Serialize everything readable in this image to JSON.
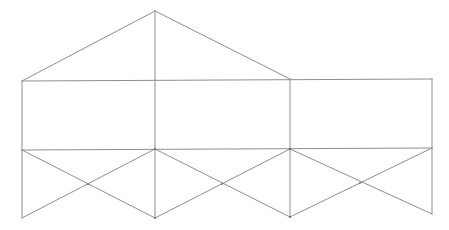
{
  "figure": {
    "title": "Line wireframe drawing of a gabled building net",
    "type": "line-drawing",
    "canvas": {
      "width": 449,
      "height": 230,
      "background": "#ffffff"
    },
    "style": {
      "stroke_color": "#8e8e8e",
      "stroke_width": 1,
      "fill": "none"
    },
    "vertices": {
      "roof_apex": {
        "x": 155,
        "y": 11
      },
      "top_left": {
        "x": 22,
        "y": 81
      },
      "top_mid": {
        "x": 155,
        "y": 80
      },
      "top_right_eave": {
        "x": 290,
        "y": 79
      },
      "top_right": {
        "x": 432,
        "y": 79
      },
      "mid_left": {
        "x": 22,
        "y": 150
      },
      "mid_center": {
        "x": 155,
        "y": 149
      },
      "mid_right_eave": {
        "x": 290,
        "y": 149
      },
      "mid_right": {
        "x": 432,
        "y": 148
      },
      "bottom_left": {
        "x": 22,
        "y": 218
      },
      "bottom_center": {
        "x": 155,
        "y": 218
      },
      "bottom_right_pin": {
        "x": 290,
        "y": 217
      },
      "bottom_right": {
        "x": 432,
        "y": 214
      },
      "cross_1": {
        "x": 88,
        "y": 184
      },
      "cross_2": {
        "x": 222,
        "y": 184
      },
      "cross_3": {
        "x": 360,
        "y": 183
      }
    },
    "segments": {
      "roof_left_slope": "M22,81 L155,11",
      "roof_right_slope": "M155,11 L290,79",
      "roof_ridge_vertical": "M155,11 L155,80",
      "top_horizontal": "M22,81 L432,79",
      "middle_horizontal": "M22,150 L432,148",
      "left_wall_upper": "M22,81 L22,150",
      "center_wall_upper": "M155,80 L155,149",
      "eave_wall_upper": "M290,79 L290,149",
      "right_wall_upper": "M432,79 L432,148",
      "left_wall_lower": "M22,150 L22,218",
      "center_wall_lower": "M155,149 L155,218",
      "eave_wall_lower": "M290,149 L290,217",
      "right_wall_lower": "M432,148 L432,214",
      "zig_down_1": "M22,150 L155,218",
      "zig_up_1": "M22,218 L155,149",
      "zig_down_2": "M155,149 L290,217",
      "zig_up_2": "M155,218 L290,149",
      "zig_down_3": "M290,149 L432,214",
      "zig_up_3": "M290,217 L432,148"
    },
    "labels": {
      "none": ""
    }
  }
}
